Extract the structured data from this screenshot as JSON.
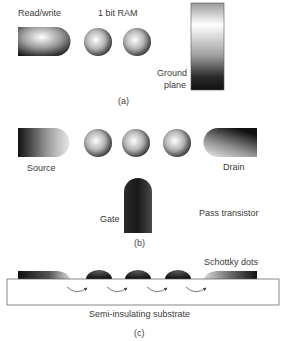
{
  "panel_a": {
    "label_readwrite": "Read/write",
    "label_ram": "1 bit RAM",
    "label_ground_1": "Ground",
    "label_ground_2": "plane",
    "caption": "(a)"
  },
  "panel_b": {
    "label_source": "Source",
    "label_drain": "Drain",
    "label_gate": "Gate",
    "label_pass": "Pass transistor",
    "caption": "(b)"
  },
  "panel_c": {
    "label_schottky": "Schottky dots",
    "label_substrate": "Semi-insulating substrate",
    "caption": "(c)"
  },
  "colors": {
    "dark": "#111111",
    "light": "#f4f4f4",
    "outline": "#555555"
  }
}
